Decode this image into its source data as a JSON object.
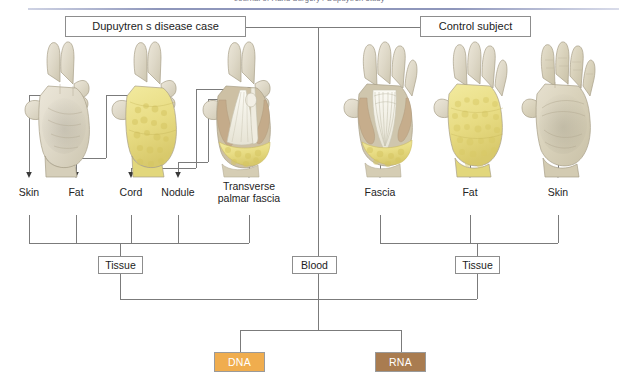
{
  "page": {
    "clipped_running_head": "Journal of Hand Surgery / Dupuytren study",
    "rule_color": "#8e96bb"
  },
  "header": {
    "groups": [
      {
        "id": "case",
        "label": "Dupuytren s disease case"
      },
      {
        "id": "control",
        "label": "Control subject"
      }
    ]
  },
  "case_group": {
    "hands": [
      {
        "name": "hand-skin",
        "caption_ref": "Skin"
      },
      {
        "name": "hand-fat",
        "caption_ref": "Fat"
      },
      {
        "name": "hand-cord",
        "caption_ref": "Cord"
      }
    ],
    "labels": [
      {
        "id": "skin",
        "text": "Skin"
      },
      {
        "id": "fat",
        "text": "Fat"
      },
      {
        "id": "cord",
        "text": "Cord"
      },
      {
        "id": "nodule",
        "text": "Nodule"
      },
      {
        "id": "tpf",
        "text": "Transverse palmar fascia"
      }
    ]
  },
  "control_group": {
    "hands": [
      {
        "name": "hand-fascia",
        "caption_ref": "Fascia"
      },
      {
        "name": "hand-fat",
        "caption_ref": "Fat"
      },
      {
        "name": "hand-skin",
        "caption_ref": "Skin"
      }
    ],
    "labels": [
      {
        "id": "fascia",
        "text": "Fascia"
      },
      {
        "id": "fat",
        "text": "Fat"
      },
      {
        "id": "skin",
        "text": "Skin"
      }
    ]
  },
  "sources": {
    "tissue_left": "Tissue",
    "blood": "Blood",
    "tissue_right": "Tissue"
  },
  "products": [
    {
      "id": "dna",
      "label": "DNA",
      "color": "#f0ad4e"
    },
    {
      "id": "rna",
      "label": "RNA",
      "color": "#a97c50"
    }
  ],
  "colors": {
    "line": "#7b7b7b",
    "box_border": "#8d8d8d",
    "text": "#1c1c1c",
    "dna": "#f0ad4e",
    "rna": "#a97c50",
    "skin": "#ded8c4",
    "fat": "#ece08e",
    "fascia": "#f4f2e7"
  }
}
